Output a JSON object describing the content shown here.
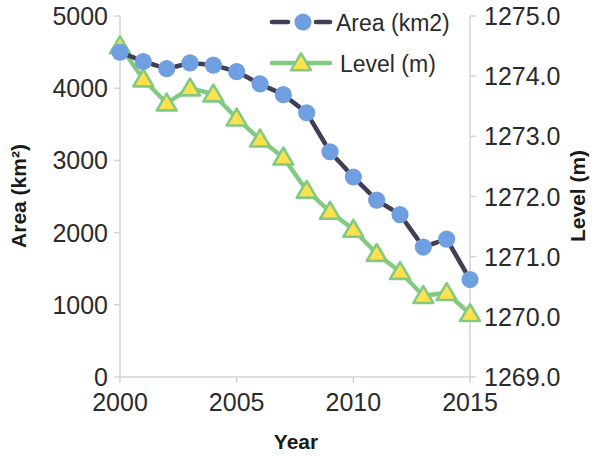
{
  "chart_data": {
    "type": "line",
    "title": "",
    "xlabel": "Year",
    "ylabel": "Area (km²)",
    "y2label": "Level (m)",
    "x": [
      2000,
      2001,
      2002,
      2003,
      2004,
      2005,
      2006,
      2007,
      2008,
      2009,
      2010,
      2011,
      2012,
      2013,
      2014,
      2015
    ],
    "xlim": [
      2000,
      2015
    ],
    "xticks": [
      2000,
      2005,
      2010,
      2015
    ],
    "xticklabels": [
      "2000",
      "2005",
      "2010",
      "2015"
    ],
    "ylim": [
      0,
      5000
    ],
    "yticks": [
      0,
      1000,
      2000,
      3000,
      4000,
      5000
    ],
    "yticklabels": [
      "0",
      "1000",
      "2000",
      "3000",
      "4000",
      "5000"
    ],
    "y2lim": [
      1269.0,
      1275.0
    ],
    "y2ticks": [
      1269.0,
      1270.0,
      1271.0,
      1272.0,
      1273.0,
      1274.0,
      1275.0
    ],
    "y2ticklabels": [
      "1269.0",
      "1270.0",
      "1271.0",
      "1272.0",
      "1273.0",
      "1274.0",
      "1275.0"
    ],
    "grid": false,
    "legend_position": "top-center",
    "series": [
      {
        "name": "Area (km2)",
        "axis": "left",
        "color": "#6f9fe0",
        "line_color": "#3f3f56",
        "line_style": "dashed",
        "marker": "circle",
        "values": [
          4500,
          4370,
          4270,
          4350,
          4320,
          4230,
          4060,
          3910,
          3660,
          3120,
          2770,
          2450,
          2250,
          1800,
          1910,
          1350
        ]
      },
      {
        "name": "Level (m)",
        "axis": "right",
        "color": "#82ca82",
        "line_color": "#82ca82",
        "line_style": "solid",
        "marker": "triangle",
        "marker_fill": "#ffe14d",
        "values": [
          1274.5,
          1273.95,
          1273.55,
          1273.8,
          1273.7,
          1273.3,
          1272.95,
          1272.65,
          1272.1,
          1271.75,
          1271.45,
          1271.05,
          1270.75,
          1270.35,
          1270.4,
          1270.05
        ],
        "values_left_equivalent": [
          4580,
          3890,
          3530,
          3780,
          3660,
          3320,
          3030,
          2790,
          2330,
          2040,
          1800,
          1470,
          1230,
          1180,
          1180,
          870
        ]
      }
    ]
  },
  "legend": {
    "entries": [
      {
        "label": "Area (km2)"
      },
      {
        "label": "Level (m)"
      }
    ]
  },
  "axes": {
    "left_title": "Area (km²)",
    "right_title": "Level (m)",
    "bottom_title": "Year"
  },
  "colors": {
    "area_marker": "#6f9fe0",
    "area_line": "#3f3f56",
    "level_line": "#82ca82",
    "level_marker_fill": "#ffe14d",
    "axis": "#d4d4d4",
    "text": "#2b2b2b"
  }
}
